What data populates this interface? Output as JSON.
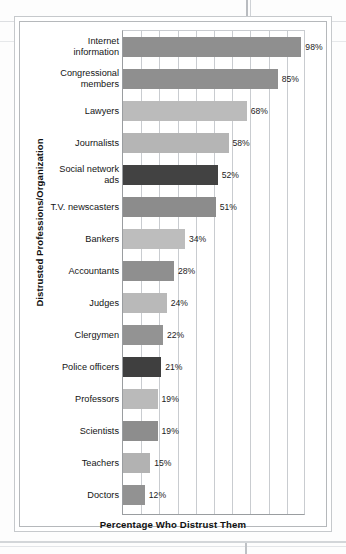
{
  "figure": {
    "frame_style": "double-rule-box",
    "background": "#ffffff"
  },
  "chart_data": {
    "type": "bar",
    "orientation": "horizontal",
    "title": "",
    "xlabel": "Percentage Who Distrust Them",
    "ylabel": "Distrusted Professions/Organization",
    "xlim": [
      0,
      100
    ],
    "grid": true,
    "grid_axis": "x",
    "gridline_interval": 10,
    "legend": null,
    "categories": [
      "Internet information",
      "Congressional members",
      "Lawyers",
      "Journalists",
      "Social network ads",
      "T.V. newscasters",
      "Bankers",
      "Accountants",
      "Judges",
      "Clergymen",
      "Police officers",
      "Professors",
      "Scientists",
      "Teachers",
      "Doctors"
    ],
    "values": [
      98,
      85,
      68,
      58,
      52,
      51,
      34,
      28,
      24,
      22,
      21,
      19,
      19,
      15,
      12
    ],
    "value_labels": [
      "98%",
      "85%",
      "68%",
      "58%",
      "52%",
      "51%",
      "34%",
      "28%",
      "24%",
      "22%",
      "21%",
      "19%",
      "19%",
      "15%",
      "12%"
    ],
    "bar_colors": [
      "#8f8f8f",
      "#8f8f8f",
      "#bbbbbb",
      "#b5b5b5",
      "#424242",
      "#8c8c8c",
      "#bdbdbd",
      "#8f8f8f",
      "#b9b9b9",
      "#939393",
      "#3f3f3f",
      "#bababa",
      "#8d8d8d",
      "#b2b2b2",
      "#929292"
    ],
    "label_lines": [
      [
        "Internet",
        "information"
      ],
      [
        "Congressional",
        "members"
      ],
      [
        "Lawyers"
      ],
      [
        "Journalists"
      ],
      [
        "Social network",
        "ads"
      ],
      [
        "T.V. newscasters"
      ],
      [
        "Bankers"
      ],
      [
        "Accountants"
      ],
      [
        "Judges"
      ],
      [
        "Clergymen"
      ],
      [
        "Police officers"
      ],
      [
        "Professors"
      ],
      [
        "Scientists"
      ],
      [
        "Teachers"
      ],
      [
        "Doctors"
      ]
    ]
  }
}
